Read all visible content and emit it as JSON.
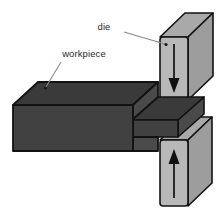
{
  "figure": {
    "background_color": "#ffffff",
    "width": 219,
    "height": 215
  },
  "labels": {
    "die": "die",
    "workpiece": "workpiece"
  },
  "colors": {
    "workpiece_front": "#414141",
    "workpiece_top": "#3a3a3a",
    "workpiece_side": "#4a4a4a",
    "die_front": "#b8b8b8",
    "die_top": "#a9a9a9",
    "die_side": "#9d9d9d",
    "outline": "#121212",
    "leader_line": "#8a8a8a",
    "text": "#2b2b2b",
    "arrow": "#111111"
  },
  "parts": {
    "upper_die": {
      "name": "upper-die",
      "arrow_direction": "down",
      "arrow_label": "downward force"
    },
    "lower_die": {
      "name": "lower-die",
      "arrow_direction": "up",
      "arrow_label": "upward force"
    },
    "workpiece": {
      "name": "workpiece-block",
      "description": "dark rectangular block narrowing into a thin extruded section between the dies"
    }
  }
}
